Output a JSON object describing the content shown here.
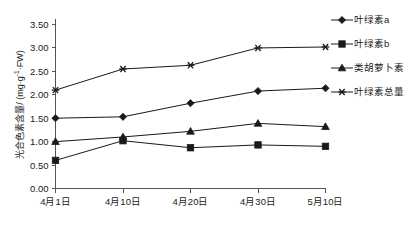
{
  "chart_data": {
    "type": "line",
    "title": "",
    "xlabel": "",
    "ylabel": "光合色素含量/ (mg·g⁻¹·FW)",
    "ylabel_main": "光合色素含量/ (mg·g",
    "ylabel_sup": "-1",
    "ylabel_tail": "·FW)",
    "categories": [
      "4月1日",
      "4月10日",
      "4月20日",
      "4月30日",
      "5月10日"
    ],
    "ylim": [
      0.0,
      3.5
    ],
    "yticks": [
      "0.00",
      "0.50",
      "1.00",
      "1.50",
      "2.00",
      "2.50",
      "3.00",
      "3.50"
    ],
    "ytick_values": [
      0.0,
      0.5,
      1.0,
      1.5,
      2.0,
      2.5,
      3.0,
      3.5
    ],
    "grid": false,
    "legend_position": "right",
    "series": [
      {
        "name": "叶绿素a",
        "marker": "diamond",
        "values": [
          1.5,
          1.53,
          1.82,
          2.08,
          2.14
        ]
      },
      {
        "name": "叶绿素b",
        "marker": "square",
        "values": [
          0.6,
          1.02,
          0.87,
          0.93,
          0.9
        ]
      },
      {
        "name": "类胡萝卜素",
        "marker": "triangle",
        "values": [
          1.0,
          1.1,
          1.22,
          1.39,
          1.32
        ]
      },
      {
        "name": "叶绿素总量",
        "marker": "star",
        "values": [
          2.1,
          2.55,
          2.63,
          3.0,
          3.02
        ]
      }
    ]
  },
  "legend": {
    "items": [
      {
        "label": "叶绿素a",
        "marker": "diamond"
      },
      {
        "label": "叶绿素b",
        "marker": "square"
      },
      {
        "label": "类胡萝卜素",
        "marker": "triangle"
      },
      {
        "label": "叶绿素总量",
        "marker": "star"
      }
    ]
  },
  "caption": ""
}
